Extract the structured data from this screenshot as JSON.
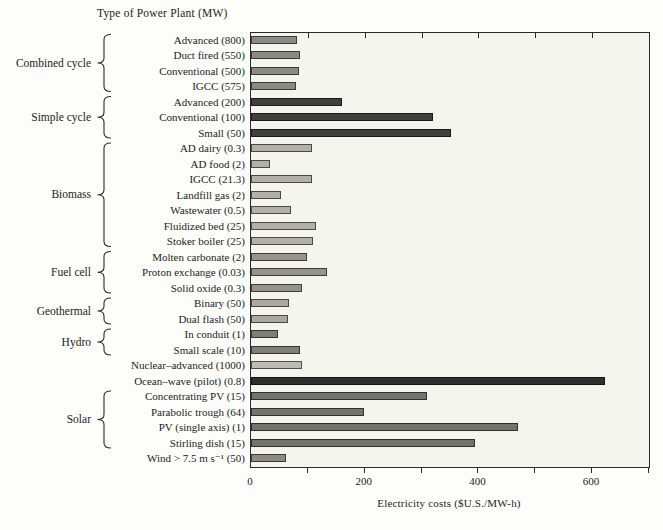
{
  "chart_data": {
    "type": "bar",
    "orientation": "horizontal",
    "title": "Type of Power Plant  (MW)",
    "xlabel": "Electricity costs ($U.S./MW-h)",
    "xlim": [
      0,
      700
    ],
    "xticks_values": [
      0,
      200,
      400,
      600
    ],
    "xticks_labels": [
      "0",
      "200",
      "400",
      "600"
    ],
    "xticks_minor": [
      100,
      200,
      300,
      400,
      500,
      600,
      700
    ],
    "grid": false,
    "legend": false,
    "plot_background": "#f5f5f0",
    "frame_color": "#2a2a2a",
    "groups": [
      {
        "name": "Combined cycle",
        "color": "#8b8b85",
        "rows": [
          {
            "label": "Advanced (800)",
            "value": 80
          },
          {
            "label": "Duct fired (550)",
            "value": 86
          },
          {
            "label": "Conventional (500)",
            "value": 85
          },
          {
            "label": "IGCC (575)",
            "value": 79
          }
        ]
      },
      {
        "name": "Simple cycle",
        "color": "#3f3f3d",
        "rows": [
          {
            "label": "Advanced (200)",
            "value": 160
          },
          {
            "label": "Conventional (100)",
            "value": 320
          },
          {
            "label": "Small  (50)",
            "value": 351
          }
        ]
      },
      {
        "name": "Biomass",
        "color": "#b1b1a9",
        "rows": [
          {
            "label": "AD dairy (0.3)",
            "value": 108
          },
          {
            "label": "AD food (2)",
            "value": 33
          },
          {
            "label": "IGCC (21.3)",
            "value": 107
          },
          {
            "label": "Landfill gas (2)",
            "value": 52
          },
          {
            "label": "Wastewater (0.5)",
            "value": 70
          },
          {
            "label": "Fluidized bed (25)",
            "value": 115
          },
          {
            "label": "Stoker boiler (25)",
            "value": 109
          }
        ]
      },
      {
        "name": "Fuel cell",
        "color": "#94948d",
        "rows": [
          {
            "label": "Molten carbonate (2)",
            "value": 98
          },
          {
            "label": "Proton exchange (0.03)",
            "value": 134
          },
          {
            "label": "Solid oxide (0.3)",
            "value": 89
          }
        ]
      },
      {
        "name": "Geothermal",
        "color": "#a9a9a1",
        "rows": [
          {
            "label": "Binary (50)",
            "value": 66
          },
          {
            "label": "Dual flash (50)",
            "value": 65
          }
        ]
      },
      {
        "name": "Hydro",
        "color": "#7f7f79",
        "rows": [
          {
            "label": "In conduit (1)",
            "value": 47
          },
          {
            "label": "Small scale (10)",
            "value": 86
          }
        ]
      },
      {
        "name": "",
        "color": "#bcbcb2",
        "rows": [
          {
            "label": "Nuclear–advanced (1000)",
            "value": 90,
            "color": "#bcbcb2"
          },
          {
            "label": "Ocean–wave (pilot) (0.8)",
            "value": 622,
            "color": "#2f2f2f"
          }
        ]
      },
      {
        "name": "Solar",
        "color": "#73736d",
        "rows": [
          {
            "label": "Concentrating PV (15)",
            "value": 309
          },
          {
            "label": "Parabolic trough (64)",
            "value": 199
          },
          {
            "label": "PV (single axis) (1)",
            "value": 469
          },
          {
            "label": "Stirling dish (15)",
            "value": 394
          }
        ]
      },
      {
        "name": "",
        "color": "#8c8c85",
        "rows": [
          {
            "label": "Wind > 7.5 m s⁻¹ (50)",
            "value": 61,
            "color": "#8c8c85"
          }
        ]
      }
    ]
  }
}
